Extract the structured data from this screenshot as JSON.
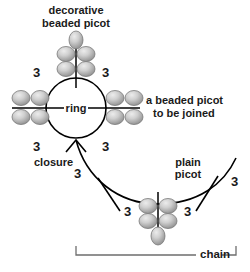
{
  "diagram": {
    "background_color": "#ffffff",
    "line_color": "#000000",
    "bead_fill_light": "#dedede",
    "bead_fill_dark": "#8a8a8a",
    "bead_stroke": "#6f6f6f",
    "text_color": "#1a1a1a"
  },
  "labels": {
    "decorative_beaded_picot_l1": "decorative",
    "decorative_beaded_picot_l2": "beaded picot",
    "ring": "ring",
    "beaded_picot_join_l1": "a beaded picot",
    "beaded_picot_join_l2": "to be joined",
    "closure": "closure",
    "plain_picot_l1": "plain",
    "plain_picot_l2": "picot",
    "chain": "chain"
  },
  "stitch_counts": {
    "ring_top_left": "3",
    "ring_top_right": "3",
    "ring_bottom_left": "3",
    "ring_bottom_right": "3",
    "chain_upper": "3",
    "chain_picot_left": "3",
    "chain_picot_right": "3",
    "chain_far_right": "3"
  },
  "bead_groups": {
    "decorative_picot": {
      "name": "decorative-beaded-picot",
      "bead_count": 5,
      "arrangement": "2x2-plus-one-top"
    },
    "left_picot": {
      "name": "left-beaded-picot",
      "bead_count": 4,
      "arrangement": "2x2"
    },
    "right_picot": {
      "name": "right-beaded-picot",
      "bead_count": 4,
      "arrangement": "2x2"
    },
    "chain_picot": {
      "name": "chain-beaded-picot",
      "bead_count": 5,
      "arrangement": "2x2-plus-one-bottom"
    }
  },
  "shapes": {
    "ring_center_x": 76,
    "ring_center_y": 108,
    "ring_radius": 30,
    "bracket_left_x": 76,
    "bracket_right_x": 236,
    "bracket_y": 255
  }
}
